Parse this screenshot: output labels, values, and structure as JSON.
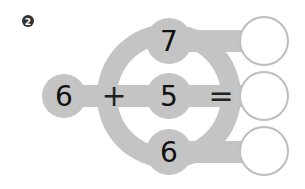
{
  "problem": {
    "number_badge": "2",
    "left_operand": "6",
    "plus_sign": "+",
    "equals_sign": "=",
    "addends": [
      "7",
      "5",
      "6"
    ],
    "answers": [
      "",
      "",
      ""
    ]
  },
  "colors": {
    "shape_gray": "#c4c4c4",
    "answer_circle_stroke": "#bdbdbd",
    "badge": "#333333",
    "text": "#111111"
  }
}
